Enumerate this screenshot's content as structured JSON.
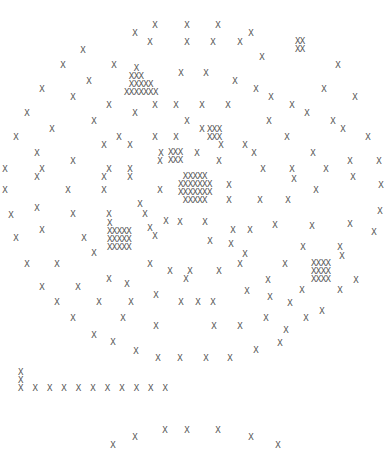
{
  "glyph": "X",
  "color": "#555555",
  "singles": [
    [
      155,
      25
    ],
    [
      187,
      25
    ],
    [
      218,
      25
    ],
    [
      135,
      33
    ],
    [
      251,
      33
    ],
    [
      150,
      42
    ],
    [
      187,
      42
    ],
    [
      213,
      42
    ],
    [
      240,
      42
    ],
    [
      83,
      50
    ],
    [
      262,
      57
    ],
    [
      63,
      65
    ],
    [
      114,
      65
    ],
    [
      338,
      65
    ],
    [
      181,
      73
    ],
    [
      206,
      73
    ],
    [
      235,
      81
    ],
    [
      42,
      89
    ],
    [
      89,
      81
    ],
    [
      73,
      97
    ],
    [
      109,
      105
    ],
    [
      155,
      105
    ],
    [
      256,
      89
    ],
    [
      271,
      97
    ],
    [
      292,
      105
    ],
    [
      324,
      89
    ],
    [
      355,
      97
    ],
    [
      135,
      113
    ],
    [
      176,
      105
    ],
    [
      202,
      105
    ],
    [
      228,
      105
    ],
    [
      187,
      121
    ],
    [
      307,
      113
    ],
    [
      333,
      121
    ],
    [
      27,
      113
    ],
    [
      52,
      129
    ],
    [
      94,
      121
    ],
    [
      119,
      137
    ],
    [
      155,
      137
    ],
    [
      176,
      137
    ],
    [
      202,
      129
    ],
    [
      269,
      121
    ],
    [
      287,
      137
    ],
    [
      343,
      129
    ],
    [
      368,
      137
    ],
    [
      16,
      137
    ],
    [
      37,
      153
    ],
    [
      73,
      161
    ],
    [
      104,
      145
    ],
    [
      130,
      145
    ],
    [
      161,
      153
    ],
    [
      197,
      153
    ],
    [
      219,
      161
    ],
    [
      254,
      153
    ],
    [
      313,
      153
    ],
    [
      350,
      161
    ],
    [
      5,
      169
    ],
    [
      42,
      169
    ],
    [
      109,
      169
    ],
    [
      130,
      169
    ],
    [
      160,
      161
    ],
    [
      221,
      145
    ],
    [
      245,
      145
    ],
    [
      263,
      169
    ],
    [
      292,
      169
    ],
    [
      326,
      169
    ],
    [
      379,
      161
    ],
    [
      37,
      177
    ],
    [
      104,
      177
    ],
    [
      130,
      177
    ],
    [
      229,
      185
    ],
    [
      294,
      179
    ],
    [
      353,
      177
    ],
    [
      381,
      185
    ],
    [
      5,
      190
    ],
    [
      68,
      190
    ],
    [
      104,
      190
    ],
    [
      160,
      190
    ],
    [
      229,
      200
    ],
    [
      260,
      200
    ],
    [
      288,
      200
    ],
    [
      316,
      190
    ],
    [
      380,
      211
    ],
    [
      37,
      208
    ],
    [
      73,
      214
    ],
    [
      109,
      214
    ],
    [
      140,
      204
    ],
    [
      145,
      214
    ],
    [
      180,
      222
    ],
    [
      205,
      222
    ],
    [
      233,
      230
    ],
    [
      250,
      230
    ],
    [
      275,
      225
    ],
    [
      312,
      226
    ],
    [
      350,
      224
    ],
    [
      374,
      232
    ],
    [
      11,
      215
    ],
    [
      42,
      230
    ],
    [
      84,
      238
    ],
    [
      150,
      228
    ],
    [
      155,
      236
    ],
    [
      166,
      221
    ],
    [
      210,
      241
    ],
    [
      231,
      244
    ],
    [
      245,
      254
    ],
    [
      303,
      247
    ],
    [
      340,
      247
    ],
    [
      16,
      238
    ],
    [
      27,
      264
    ],
    [
      57,
      264
    ],
    [
      94,
      253
    ],
    [
      150,
      264
    ],
    [
      170,
      271
    ],
    [
      190,
      271
    ],
    [
      219,
      271
    ],
    [
      240,
      264
    ],
    [
      285,
      264
    ],
    [
      342,
      256
    ],
    [
      356,
      280
    ],
    [
      42,
      287
    ],
    [
      78,
      287
    ],
    [
      109,
      279
    ],
    [
      127,
      284
    ],
    [
      156,
      295
    ],
    [
      186,
      279
    ],
    [
      198,
      302
    ],
    [
      247,
      291
    ],
    [
      268,
      280
    ],
    [
      302,
      290
    ],
    [
      340,
      290
    ],
    [
      57,
      302
    ],
    [
      99,
      302
    ],
    [
      131,
      302
    ],
    [
      181,
      302
    ],
    [
      213,
      302
    ],
    [
      270,
      297
    ],
    [
      286,
      330
    ],
    [
      73,
      318
    ],
    [
      123,
      318
    ],
    [
      156,
      326
    ],
    [
      214,
      326
    ],
    [
      240,
      326
    ],
    [
      266,
      318
    ],
    [
      290,
      303
    ],
    [
      306,
      318
    ],
    [
      322,
      311
    ],
    [
      94,
      335
    ],
    [
      113,
      342
    ],
    [
      136,
      351
    ],
    [
      158,
      358
    ],
    [
      180,
      358
    ],
    [
      206,
      358
    ],
    [
      230,
      358
    ],
    [
      256,
      350
    ],
    [
      280,
      343
    ]
  ],
  "blocks": [
    {
      "x": 124,
      "y": 64,
      "lines": [
        "  X",
        " XXX",
        " XXXXX",
        "XXXXXXX"
      ]
    },
    {
      "x": 207,
      "y": 125,
      "lines": [
        "XXX",
        "XXX"
      ]
    },
    {
      "x": 168,
      "y": 148,
      "lines": [
        "XXX",
        "XXX"
      ]
    },
    {
      "x": 178,
      "y": 172,
      "lines": [
        " XXXXX",
        "XXXXXXX",
        "XXXXXXX",
        " XXXXX"
      ]
    },
    {
      "x": 107,
      "y": 219,
      "lines": [
        "X",
        "XXXXX",
        "XXXXX",
        "XXXXX"
      ]
    },
    {
      "x": 311,
      "y": 259,
      "lines": [
        "XXXX",
        "XXXX",
        "XXXX"
      ]
    },
    {
      "x": 295,
      "y": 37,
      "lines": [
        "XX",
        "XX"
      ]
    },
    {
      "x": 18,
      "y": 368,
      "lines": [
        "X",
        "X",
        "X  X  X  X  X  X  X  X  X  X  X"
      ]
    }
  ],
  "bottom_singles": [
    [
      113,
      445
    ],
    [
      135,
      437
    ],
    [
      165,
      430
    ],
    [
      187,
      430
    ],
    [
      218,
      430
    ],
    [
      251,
      437
    ],
    [
      278,
      445
    ]
  ]
}
